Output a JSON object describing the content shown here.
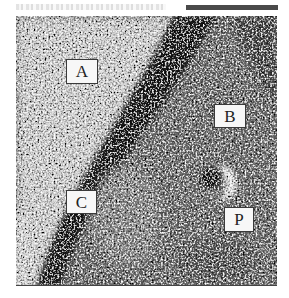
{
  "figure": {
    "labels": [
      {
        "id": "A",
        "text": "A",
        "region": "light-background"
      },
      {
        "id": "B",
        "text": "B",
        "region": "granular-interior"
      },
      {
        "id": "C",
        "text": "C",
        "region": "dark-boundary-band"
      },
      {
        "id": "P",
        "text": "P",
        "region": "particle"
      }
    ],
    "colors": {
      "light_region": "#c8c8c8",
      "dark_band": "#1e1e1e",
      "mid_region": "#6e6e6e",
      "particle_core": "#141414",
      "particle_halo": "#f0f0f0",
      "label_bg": "#f7f7f7",
      "label_border": "#3a3a3a"
    }
  }
}
